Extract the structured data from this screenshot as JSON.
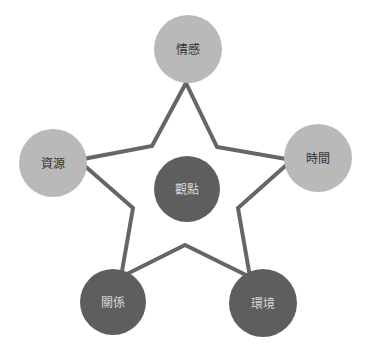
{
  "diagram": {
    "type": "star-concept-map",
    "colors": {
      "light_node": "#b9b9b9",
      "dark_node": "#5e5e5e",
      "star_line": "#666666",
      "background": "#ffffff"
    },
    "center": {
      "label": "觀點",
      "shade": "dark"
    },
    "nodes": [
      {
        "id": "top",
        "label": "情感",
        "shade": "light"
      },
      {
        "id": "right",
        "label": "時間",
        "shade": "light"
      },
      {
        "id": "bottom-right",
        "label": "環境",
        "shade": "dark"
      },
      {
        "id": "bottom-left",
        "label": "關係",
        "shade": "dark"
      },
      {
        "id": "left",
        "label": "資源",
        "shade": "light"
      }
    ]
  }
}
